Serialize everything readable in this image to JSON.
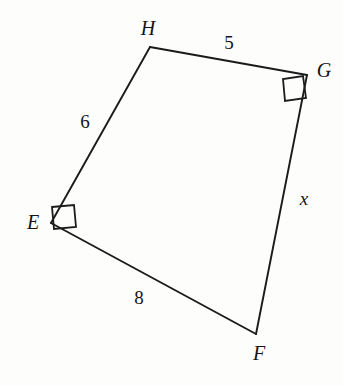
{
  "figure": {
    "kind": "geometry-diagram",
    "shape": "quadrilateral",
    "background_color": "#fdfdfc",
    "stroke_color": "#1b1b1b",
    "text_color": "#141414",
    "width": 343,
    "height": 385
  },
  "vertices": [
    {
      "name": "E",
      "label": "E",
      "x": 51,
      "y": 223,
      "label_x": 33,
      "label_y": 224,
      "right_angle": true
    },
    {
      "name": "H",
      "label": "H",
      "x": 150,
      "y": 47,
      "label_x": 148,
      "label_y": 30,
      "right_angle": false
    },
    {
      "name": "G",
      "label": "G",
      "x": 307,
      "y": 75,
      "label_x": 324,
      "label_y": 72,
      "right_angle": true
    },
    {
      "name": "F",
      "label": "F",
      "x": 256,
      "y": 334,
      "label_x": 259,
      "label_y": 355,
      "right_angle": false
    }
  ],
  "edges": [
    {
      "name": "EH",
      "from": "E",
      "to": "H",
      "length_label": "6",
      "label_x": 85,
      "label_y": 124,
      "italic": false
    },
    {
      "name": "HG",
      "from": "H",
      "to": "G",
      "length_label": "5",
      "label_x": 229,
      "label_y": 45,
      "italic": false
    },
    {
      "name": "GF",
      "from": "G",
      "to": "F",
      "length_label": "x",
      "label_x": 304,
      "label_y": 201,
      "italic": true
    },
    {
      "name": "FE",
      "from": "F",
      "to": "E",
      "length_label": "8",
      "label_x": 139,
      "label_y": 300,
      "italic": false
    }
  ],
  "right_angle_marks": [
    {
      "name": "right-angle-mark-E",
      "at": "E",
      "points": "52,207 74,205 76,227 54,229"
    },
    {
      "name": "right-angle-mark-G",
      "at": "G",
      "points": "303,76 306,98 285,101 283,79"
    }
  ]
}
